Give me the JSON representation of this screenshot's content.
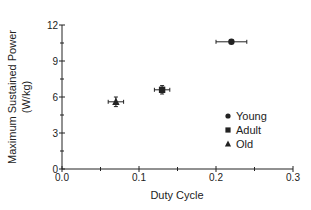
{
  "chart_data": {
    "type": "scatter",
    "title": "",
    "xlabel": "Duty Cycle",
    "ylabel": "Maximum Sustained Power",
    "ylabel_units": "(W/kg)",
    "xlim": [
      0.0,
      0.3
    ],
    "ylim": [
      0,
      12
    ],
    "x_ticks": [
      0.0,
      0.1,
      0.2,
      0.3
    ],
    "x_tick_labels": [
      "0.0",
      "0.1",
      "0.2",
      "0.3"
    ],
    "x_minor_ticks": [
      0.05,
      0.15,
      0.25
    ],
    "y_ticks": [
      0,
      3,
      6,
      9,
      12
    ],
    "y_tick_labels": [
      "0",
      "3",
      "6",
      "9",
      "12"
    ],
    "y_minor_ticks": [
      1.5,
      4.5,
      7.5,
      10.5
    ],
    "grid": false,
    "legend_position": "right-center inside plot",
    "series": [
      {
        "name": "Young",
        "marker": "circle",
        "x": 0.22,
        "y": 10.6,
        "x_err": 0.02,
        "y_err": 0.15
      },
      {
        "name": "Adult",
        "marker": "square",
        "x": 0.13,
        "y": 6.6,
        "x_err": 0.01,
        "y_err": 0.35
      },
      {
        "name": "Old",
        "marker": "triangle",
        "x": 0.07,
        "y": 5.6,
        "x_err": 0.01,
        "y_err": 0.4
      }
    ]
  },
  "legend": {
    "items": [
      {
        "label": "Young",
        "marker": "circle"
      },
      {
        "label": "Adult",
        "marker": "square"
      },
      {
        "label": "Old",
        "marker": "triangle"
      }
    ]
  },
  "colors": {
    "ink": "#222222",
    "background": "#ffffff"
  }
}
